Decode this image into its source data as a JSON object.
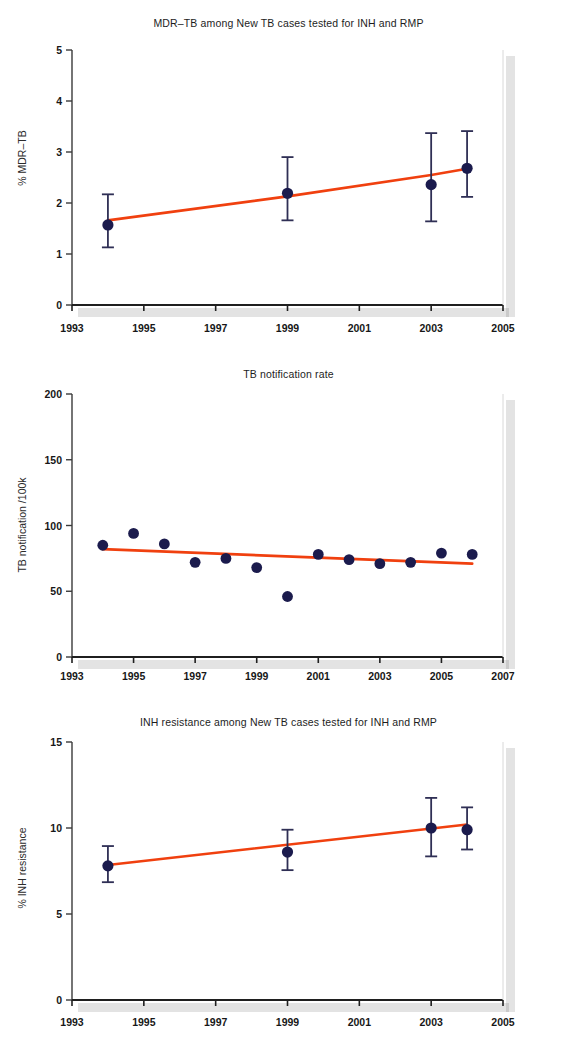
{
  "figure": {
    "background": "#ffffff",
    "marker_color": "#1b1b4d",
    "trend_color": "#f0400f",
    "axis_color": "#3a3a3a",
    "error_bar_color": "#2f2f55"
  },
  "charts": [
    {
      "id": "mdr-tb",
      "title": "MDR–TB among New TB cases tested for INH and RMP",
      "ylabel": "% MDR–TB",
      "xlabel": "",
      "type": "scatter",
      "xlim": [
        1993,
        2005
      ],
      "ylim": [
        0,
        5
      ],
      "xticks": [
        1993,
        1995,
        1997,
        1999,
        2001,
        2003,
        2005
      ],
      "xtick_labels": [
        "1993",
        "1995",
        "1997",
        "1999",
        "2001",
        "2003",
        "2005"
      ],
      "yticks": [
        0,
        1,
        2,
        3,
        4,
        5
      ],
      "ytick_labels": [
        "0",
        "1",
        "2",
        "3",
        "4",
        "5"
      ],
      "grid": false,
      "legend": "none",
      "x": [
        1994,
        1999,
        2003,
        2004
      ],
      "values": [
        1.57,
        2.19,
        2.36,
        2.68
      ],
      "err_low": [
        1.13,
        1.66,
        1.64,
        2.12
      ],
      "err_high": [
        2.17,
        2.9,
        3.37,
        3.41
      ],
      "trend": {
        "x": [
          1994,
          1999,
          2003,
          2004
        ],
        "y": [
          1.66,
          2.13,
          2.55,
          2.67
        ]
      }
    },
    {
      "id": "tb-notification-rate",
      "title": "TB notification rate",
      "ylabel": "TB notification /100k",
      "xlabel": "",
      "type": "scatter",
      "xlim": [
        1993,
        2007
      ],
      "ylim": [
        0,
        200
      ],
      "xticks": [
        1993,
        1995,
        1997,
        1999,
        2001,
        2003,
        2005,
        2007
      ],
      "xtick_labels": [
        "1993",
        "1995",
        "1997",
        "1999",
        "2001",
        "2003",
        "2005",
        "2007"
      ],
      "yticks": [
        0,
        50,
        100,
        150,
        200
      ],
      "ytick_labels": [
        "0",
        "50",
        "100",
        "150",
        "200"
      ],
      "grid": false,
      "legend": "none",
      "x": [
        1994,
        1995,
        1996,
        1997,
        1998,
        1999,
        2000,
        2001,
        2002,
        2003,
        2004,
        2005,
        2006
      ],
      "values": [
        85,
        94,
        86,
        72,
        75,
        68,
        46,
        78,
        74,
        71,
        72,
        79,
        78
      ],
      "trend": {
        "x": [
          1994,
          2006
        ],
        "y": [
          82,
          71
        ]
      }
    },
    {
      "id": "inh-resistance",
      "title": "INH resistance among New TB cases tested for INH and RMP",
      "ylabel": "% INH resistance",
      "xlabel": "",
      "type": "scatter",
      "xlim": [
        1993,
        2005
      ],
      "ylim": [
        0,
        15
      ],
      "xticks": [
        1993,
        1995,
        1997,
        1999,
        2001,
        2003,
        2005
      ],
      "xtick_labels": [
        "1993",
        "1995",
        "1997",
        "1999",
        "2001",
        "2003",
        "2005"
      ],
      "yticks": [
        0,
        5,
        10,
        15
      ],
      "ytick_labels": [
        "0",
        "5",
        "10",
        "15"
      ],
      "grid": false,
      "legend": "none",
      "x": [
        1994,
        1999,
        2003,
        2004
      ],
      "values": [
        7.8,
        8.6,
        10.0,
        9.9
      ],
      "err_low": [
        6.85,
        7.55,
        8.35,
        8.75
      ],
      "err_high": [
        8.95,
        9.9,
        11.75,
        11.2
      ],
      "trend": {
        "x": [
          1994,
          2004
        ],
        "y": [
          7.85,
          10.2
        ]
      }
    }
  ],
  "chart_data": {
    "type": "scatter",
    "panels": [
      {
        "title": "MDR–TB among New TB cases tested for INH and RMP",
        "xlabel": "",
        "ylabel": "% MDR–TB",
        "xlim": [
          1993,
          2005
        ],
        "ylim": [
          0,
          5
        ],
        "x": [
          1994,
          1999,
          2003,
          2004
        ],
        "y": [
          1.57,
          2.19,
          2.36,
          2.68
        ],
        "yerr_low": [
          1.13,
          1.66,
          1.64,
          2.12
        ],
        "yerr_high": [
          2.17,
          2.9,
          3.37,
          3.41
        ],
        "trendline": {
          "x": [
            1994,
            2004
          ],
          "y": [
            1.66,
            2.67
          ]
        },
        "xticks": [
          1993,
          1995,
          1997,
          1999,
          2001,
          2003,
          2005
        ],
        "yticks": [
          0,
          1,
          2,
          3,
          4,
          5
        ],
        "grid": false,
        "legend": "none"
      },
      {
        "title": "TB notification rate",
        "xlabel": "",
        "ylabel": "TB notification /100k",
        "xlim": [
          1993,
          2007
        ],
        "ylim": [
          0,
          200
        ],
        "x": [
          1994,
          1995,
          1996,
          1997,
          1998,
          1999,
          2000,
          2001,
          2002,
          2003,
          2004,
          2005,
          2006
        ],
        "y": [
          85,
          94,
          86,
          72,
          75,
          68,
          46,
          78,
          74,
          71,
          72,
          79,
          78
        ],
        "trendline": {
          "x": [
            1994,
            2006
          ],
          "y": [
            82,
            71
          ]
        },
        "xticks": [
          1993,
          1995,
          1997,
          1999,
          2001,
          2003,
          2005,
          2007
        ],
        "yticks": [
          0,
          50,
          100,
          150,
          200
        ],
        "grid": false,
        "legend": "none"
      },
      {
        "title": "INH resistance among New TB cases tested for INH and RMP",
        "xlabel": "",
        "ylabel": "% INH resistance",
        "xlim": [
          1993,
          2005
        ],
        "ylim": [
          0,
          15
        ],
        "x": [
          1994,
          1999,
          2003,
          2004
        ],
        "y": [
          7.8,
          8.6,
          10.0,
          9.9
        ],
        "yerr_low": [
          6.85,
          7.55,
          8.35,
          8.75
        ],
        "yerr_high": [
          8.95,
          9.9,
          11.75,
          11.2
        ],
        "trendline": {
          "x": [
            1994,
            2004
          ],
          "y": [
            7.85,
            10.2
          ]
        },
        "xticks": [
          1993,
          1995,
          1997,
          1999,
          2001,
          2003,
          2005
        ],
        "yticks": [
          0,
          5,
          10,
          15
        ],
        "grid": false,
        "legend": "none"
      }
    ]
  }
}
